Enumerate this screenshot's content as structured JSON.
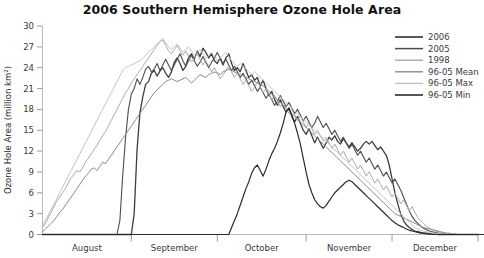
{
  "chart_data": {
    "type": "line",
    "title": "2006 Southern Hemisphere Ozone Hole Area",
    "xlabel": "",
    "ylabel": "Ozone Hole Area (million km²)",
    "ylim": [
      0,
      30
    ],
    "yticks": [
      0,
      3,
      6,
      9,
      12,
      15,
      18,
      21,
      24,
      27,
      30
    ],
    "grid": false,
    "legend_position": "top-right",
    "xlim": [
      "August 1",
      "December 31"
    ],
    "xtick_labels": [
      "August",
      "September",
      "October",
      "November",
      "December"
    ],
    "x_month_starts": [
      0,
      31,
      61,
      92,
      122
    ],
    "x_total_days": 153,
    "series": [
      {
        "name": "2006",
        "color": "#3d3d3d",
        "width": 1.3,
        "values": [
          0,
          0,
          0,
          0,
          0,
          0,
          0,
          0,
          0,
          0,
          0,
          0,
          0,
          0,
          0,
          0,
          0,
          0,
          0,
          0,
          0,
          0,
          0,
          0,
          0,
          0,
          0,
          0,
          0,
          0,
          0,
          0,
          3.0,
          12.2,
          17.5,
          19.8,
          21.6,
          22.0,
          23.2,
          23.6,
          22.8,
          23.5,
          24.0,
          23.2,
          22.6,
          23.4,
          24.8,
          25.4,
          24.6,
          23.6,
          24.2,
          25.5,
          26.0,
          25.2,
          26.4,
          25.6,
          26.8,
          26.2,
          25.4,
          26.0,
          25.0,
          24.6,
          25.4,
          24.4,
          25.4,
          26.0,
          24.6,
          23.6,
          24.0,
          23.4,
          24.6,
          23.6,
          22.6,
          23.0,
          22.2,
          22.6,
          21.4,
          22.2,
          21.0,
          20.0,
          20.6,
          19.4,
          18.6,
          19.4,
          18.4,
          17.6,
          18.2,
          17.0,
          16.2,
          17.0,
          16.0,
          15.0,
          14.4,
          15.2,
          14.2,
          13.2,
          14.0,
          13.2,
          12.4,
          13.2,
          14.0,
          13.6,
          14.2,
          13.4,
          13.0,
          13.8,
          13.2,
          12.6,
          13.2,
          12.6,
          12.0,
          12.4,
          13.0,
          13.4,
          13.0,
          13.4,
          12.8,
          12.2,
          12.6,
          12.0,
          11.4,
          10.0,
          8.0,
          6.0,
          4.4,
          3.0,
          2.0,
          1.4,
          1.0,
          0.7,
          0.5,
          0.4,
          0.3,
          0.2,
          0.2,
          0.1,
          0.1,
          0.1,
          0,
          0,
          0,
          0,
          0,
          0,
          0,
          0,
          0,
          0,
          0,
          0,
          0,
          0,
          0
        ]
      },
      {
        "name": "2005",
        "color": "#4d4d4d",
        "width": 1.1,
        "values": [
          0,
          0,
          0,
          0,
          0,
          0,
          0,
          0,
          0,
          0,
          0,
          0,
          0,
          0,
          0,
          0,
          0,
          0,
          0,
          0,
          0,
          0,
          0,
          0,
          0,
          0,
          0,
          2.0,
          8.5,
          14.0,
          18.0,
          20.2,
          21.0,
          22.4,
          21.6,
          22.6,
          23.8,
          24.2,
          23.4,
          23.8,
          24.6,
          23.6,
          24.4,
          25.2,
          24.4,
          23.6,
          24.4,
          25.2,
          26.0,
          25.0,
          24.2,
          25.0,
          25.8,
          25.0,
          24.2,
          24.8,
          25.6,
          24.8,
          24.0,
          24.8,
          25.4,
          26.2,
          25.4,
          24.6,
          25.2,
          24.4,
          23.6,
          24.2,
          23.4,
          22.6,
          23.2,
          22.4,
          21.6,
          22.2,
          21.4,
          20.6,
          21.2,
          20.4,
          19.6,
          20.2,
          19.4,
          18.6,
          19.2,
          20.0,
          19.2,
          18.4,
          19.0,
          18.2,
          17.4,
          18.0,
          17.2,
          16.4,
          17.0,
          16.2,
          15.4,
          16.0,
          17.0,
          16.2,
          15.4,
          16.0,
          15.2,
          14.4,
          15.0,
          14.2,
          13.4,
          14.0,
          13.2,
          12.4,
          13.0,
          12.2,
          11.4,
          12.0,
          11.2,
          10.4,
          11.0,
          10.2,
          9.4,
          10.0,
          9.2,
          8.4,
          9.0,
          8.2,
          7.4,
          8.0,
          7.2,
          6.4,
          5.4,
          4.4,
          3.4,
          2.6,
          2.0,
          1.6,
          1.2,
          0.9,
          0.7,
          0.5,
          0.4,
          0.3,
          0.2,
          0.1,
          0.1,
          0,
          0,
          0,
          0,
          0,
          0,
          0,
          0,
          0,
          0,
          0,
          0
        ]
      },
      {
        "name": "1998",
        "color": "#aaaaaa",
        "width": 1.0,
        "values": [
          1.0,
          1.6,
          2.4,
          3.2,
          4.0,
          4.8,
          5.4,
          6.0,
          6.6,
          7.4,
          8.2,
          8.6,
          9.2,
          9.0,
          9.6,
          10.4,
          11.0,
          11.6,
          12.2,
          12.8,
          13.6,
          14.2,
          14.8,
          15.6,
          16.4,
          17.2,
          18.0,
          18.8,
          19.6,
          20.4,
          21.0,
          21.8,
          22.4,
          23.0,
          23.6,
          24.2,
          24.8,
          25.4,
          26.0,
          26.6,
          27.2,
          27.8,
          28.0,
          27.2,
          26.4,
          26.0,
          26.6,
          27.2,
          26.4,
          25.8,
          26.4,
          25.6,
          24.8,
          25.4,
          26.0,
          25.2,
          24.4,
          25.0,
          24.2,
          23.4,
          24.0,
          23.2,
          22.4,
          23.0,
          23.6,
          24.2,
          23.4,
          22.6,
          23.2,
          22.4,
          21.6,
          22.2,
          21.4,
          20.6,
          21.2,
          22.0,
          21.2,
          20.4,
          21.0,
          20.2,
          19.4,
          20.0,
          19.2,
          18.4,
          19.0,
          18.2,
          17.4,
          18.0,
          17.2,
          16.4,
          17.0,
          16.2,
          15.4,
          16.0,
          15.2,
          14.4,
          15.0,
          14.2,
          13.4,
          14.0,
          13.2,
          12.4,
          13.0,
          12.2,
          11.4,
          12.0,
          11.2,
          10.4,
          11.0,
          10.2,
          9.4,
          10.0,
          9.2,
          8.4,
          9.0,
          8.2,
          7.4,
          8.0,
          7.2,
          6.4,
          7.0,
          6.2,
          5.4,
          6.0,
          5.2,
          4.4,
          5.0,
          4.2,
          3.4,
          4.0,
          3.2,
          2.4,
          2.0,
          1.6,
          1.2,
          0.9,
          0.7,
          0.5,
          0.4,
          0.3,
          0.2,
          0.1,
          0.1,
          0,
          0,
          0,
          0,
          0,
          0,
          0,
          0,
          0,
          0,
          0,
          0
        ]
      },
      {
        "name": "96-05 Mean",
        "color": "#8a8a8a",
        "width": 1.0,
        "values": [
          0.4,
          0.8,
          1.2,
          1.6,
          2.0,
          2.6,
          3.2,
          3.6,
          4.2,
          4.8,
          5.4,
          6.0,
          6.6,
          7.2,
          7.8,
          8.4,
          8.8,
          9.4,
          9.6,
          9.2,
          9.8,
          10.4,
          10.2,
          10.8,
          11.4,
          12.0,
          12.6,
          13.2,
          13.8,
          14.4,
          15.0,
          15.6,
          16.2,
          16.8,
          17.4,
          18.0,
          18.6,
          19.2,
          19.8,
          20.4,
          20.8,
          21.2,
          21.6,
          22.0,
          22.2,
          22.4,
          22.2,
          22.0,
          22.2,
          22.4,
          22.6,
          22.2,
          21.8,
          22.2,
          22.6,
          23.0,
          22.8,
          22.6,
          23.0,
          23.2,
          23.4,
          23.2,
          23.0,
          23.4,
          23.6,
          23.8,
          23.6,
          23.4,
          23.2,
          23.0,
          22.8,
          22.6,
          22.4,
          22.2,
          22.0,
          21.8,
          21.6,
          21.4,
          21.0,
          20.6,
          20.2,
          19.8,
          19.4,
          19.0,
          18.6,
          18.2,
          17.8,
          17.4,
          17.0,
          16.6,
          16.2,
          15.8,
          15.4,
          15.0,
          14.6,
          14.2,
          13.8,
          13.4,
          13.0,
          12.6,
          12.2,
          11.8,
          11.4,
          11.0,
          10.6,
          10.2,
          9.8,
          9.4,
          9.0,
          8.6,
          8.2,
          7.8,
          7.4,
          7.0,
          6.6,
          6.2,
          5.8,
          5.4,
          5.0,
          4.6,
          4.2,
          3.8,
          3.4,
          3.0,
          2.8,
          2.6,
          2.4,
          2.2,
          2.0,
          1.8,
          1.6,
          1.4,
          1.2,
          1.0,
          0.9,
          0.8,
          0.7,
          0.6,
          0.5,
          0.4,
          0.3,
          0.2,
          0.2,
          0.1,
          0.1,
          0,
          0,
          0,
          0,
          0,
          0,
          0,
          0,
          0,
          0
        ]
      },
      {
        "name": "96-05 Max",
        "color": "#c4c4c4",
        "width": 1.0,
        "values": [
          1.2,
          2.0,
          2.8,
          3.6,
          4.4,
          5.2,
          6.0,
          6.8,
          7.6,
          8.4,
          9.2,
          10.0,
          10.8,
          11.6,
          12.4,
          13.2,
          14.0,
          14.8,
          15.6,
          16.4,
          17.2,
          18.0,
          18.8,
          19.6,
          20.4,
          21.2,
          22.0,
          22.8,
          23.6,
          24.0,
          24.2,
          24.4,
          24.6,
          24.8,
          25.0,
          25.4,
          25.8,
          26.2,
          26.6,
          27.0,
          27.4,
          27.8,
          28.2,
          27.6,
          27.0,
          26.6,
          27.0,
          27.4,
          26.8,
          26.2,
          26.6,
          27.0,
          26.4,
          25.8,
          26.2,
          26.6,
          26.0,
          25.4,
          25.8,
          26.2,
          25.6,
          25.0,
          25.4,
          25.8,
          26.2,
          25.6,
          25.0,
          24.6,
          24.2,
          24.6,
          24.2,
          23.8,
          23.4,
          23.0,
          23.4,
          23.0,
          22.6,
          22.2,
          21.8,
          21.4,
          21.0,
          20.6,
          20.2,
          19.8,
          19.4,
          19.0,
          18.6,
          18.2,
          17.8,
          17.4,
          17.0,
          16.6,
          16.2,
          15.8,
          15.4,
          15.0,
          14.6,
          14.2,
          13.8,
          13.4,
          13.0,
          12.6,
          12.2,
          11.8,
          11.4,
          11.0,
          10.6,
          10.2,
          9.8,
          9.4,
          9.0,
          8.6,
          8.2,
          7.8,
          7.4,
          7.0,
          6.6,
          6.2,
          5.8,
          5.4,
          5.0,
          4.6,
          4.2,
          3.8,
          3.4,
          3.0,
          2.6,
          2.2,
          1.8,
          1.4,
          1.0,
          0.8,
          0.6,
          0.5,
          0.4,
          0.3,
          0.2,
          0.2,
          0.1,
          0.1,
          0,
          0,
          0,
          0,
          0,
          0,
          0,
          0,
          0,
          0,
          0,
          0,
          0,
          0
        ]
      },
      {
        "name": "96-05 Min",
        "color": "#2b2b2b",
        "width": 1.2,
        "values": [
          0,
          0,
          0,
          0,
          0,
          0,
          0,
          0,
          0,
          0,
          0,
          0,
          0,
          0,
          0,
          0,
          0,
          0,
          0,
          0,
          0,
          0,
          0,
          0,
          0,
          0,
          0,
          0,
          0,
          0,
          0,
          0,
          0,
          0,
          0,
          0,
          0,
          0,
          0,
          0,
          0,
          0,
          0,
          0,
          0,
          0,
          0,
          0,
          0,
          0,
          0,
          0,
          0,
          0,
          0,
          0,
          0,
          0,
          0,
          0,
          0,
          0,
          0,
          0,
          0,
          0,
          1.0,
          2.0,
          3.0,
          4.2,
          5.4,
          6.6,
          7.6,
          8.8,
          9.6,
          10.0,
          9.2,
          8.4,
          9.4,
          10.6,
          11.6,
          12.4,
          13.4,
          14.6,
          16.0,
          17.6,
          18.2,
          17.2,
          16.0,
          14.6,
          13.0,
          11.0,
          9.0,
          7.2,
          6.0,
          5.0,
          4.4,
          4.0,
          3.8,
          4.2,
          4.8,
          5.4,
          6.0,
          6.4,
          6.8,
          7.2,
          7.6,
          7.8,
          7.6,
          7.2,
          6.8,
          6.4,
          6.0,
          5.6,
          5.2,
          4.8,
          4.4,
          4.0,
          3.6,
          3.2,
          2.8,
          2.4,
          2.0,
          1.7,
          1.4,
          1.2,
          1.0,
          0.8,
          0.6,
          0.5,
          0.4,
          0.3,
          0.2,
          0.2,
          0.1,
          0.1,
          0,
          0,
          0,
          0,
          0,
          0,
          0,
          0,
          0,
          0,
          0,
          0,
          0,
          0,
          0,
          0,
          0,
          0,
          0
        ]
      }
    ]
  },
  "legend": {
    "entries": [
      {
        "label": "2006"
      },
      {
        "label": "2005"
      },
      {
        "label": "1998"
      },
      {
        "label": "96-05 Mean"
      },
      {
        "label": "96-05 Max"
      },
      {
        "label": "96-05 Min"
      }
    ]
  }
}
